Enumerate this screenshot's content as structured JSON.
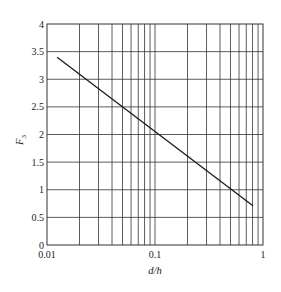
{
  "chart_data": {
    "type": "line",
    "title": "",
    "xlabel": "d/h",
    "ylabel": "F",
    "ylabel_subscript": "3",
    "xscale": "log",
    "xlim": [
      0.01,
      1
    ],
    "ylim": [
      0,
      4
    ],
    "grid": true,
    "legend": null,
    "x_ticks": [
      "0.01",
      "0.1",
      "1"
    ],
    "y_ticks": [
      "0",
      "0.5",
      "1",
      "1.5",
      "2",
      "2.5",
      "3",
      "3.5",
      "4"
    ],
    "series": [
      {
        "name": "F3",
        "x": [
          0.0124,
          0.807
        ],
        "y": [
          3.4,
          0.71
        ]
      }
    ]
  },
  "colors": {
    "line": "#1a1a1a",
    "grid": "#333333",
    "background": "#ffffff"
  }
}
